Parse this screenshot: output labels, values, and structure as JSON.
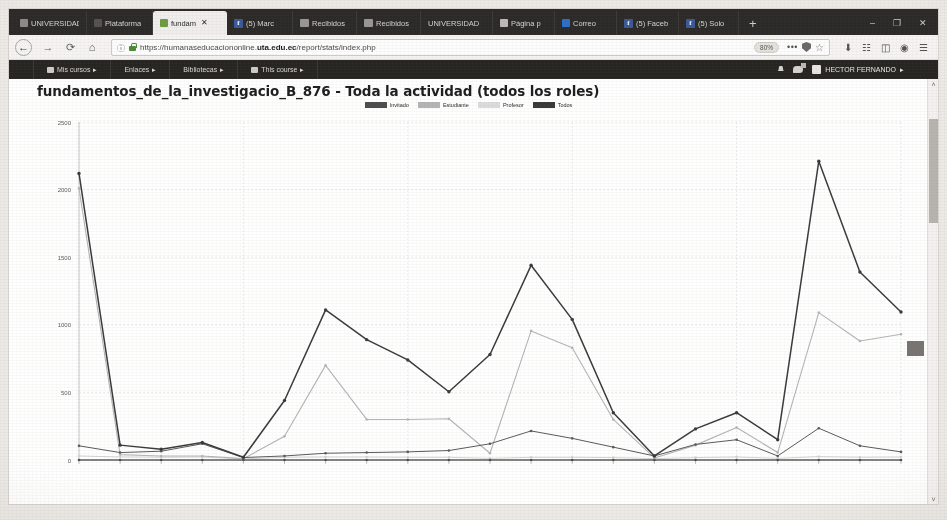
{
  "browser": {
    "tabs": [
      {
        "label": "UNIVERSIDAD",
        "icon": "page-icon",
        "active": false
      },
      {
        "label": "Plataforma",
        "icon": "page-icon",
        "active": false
      },
      {
        "label": "fundam",
        "icon": "moodle-icon",
        "active": true,
        "close": "✕"
      },
      {
        "label": "(5) Marc",
        "icon": "facebook-icon",
        "active": false
      },
      {
        "label": "Recibidos",
        "icon": "mail-icon",
        "active": false
      },
      {
        "label": "Recibidos",
        "icon": "mail-icon",
        "active": false
      },
      {
        "label": "UNIVERSIDAD",
        "icon": "page-icon",
        "active": false
      },
      {
        "label": "Página p",
        "icon": "page-icon",
        "active": false
      },
      {
        "label": "Correo",
        "icon": "outlook-icon",
        "active": false
      },
      {
        "label": "(5) Faceb",
        "icon": "facebook-icon",
        "active": false
      },
      {
        "label": "(5) Solo",
        "icon": "facebook-icon",
        "active": false
      }
    ],
    "new_tab_label": "+",
    "window_buttons": {
      "minimize": "–",
      "maximize": "❐",
      "close": "✕"
    },
    "nav": {
      "back": "←",
      "forward": "→",
      "reload": "⟳",
      "home": "⌂"
    },
    "url": {
      "info_icon": "ⓘ",
      "security_icon": "lock-icon",
      "prefix": "https://humanaseducaciononline.",
      "domain": "uta.edu.ec",
      "path": "/report/stats/index.php",
      "zoom_level": "80%",
      "more_actions": "•••",
      "placeholder": "Buscar o ingresar dirección"
    },
    "toolbar_icons": [
      "download-icon",
      "library-icon",
      "sidebar-icon",
      "account-icon",
      "menu-icon"
    ]
  },
  "moodle": {
    "nav_items": [
      {
        "label": "Mis cursos",
        "caret": "▸",
        "icon": "folder-icon"
      },
      {
        "label": "Enlaces",
        "caret": "▸",
        "icon": ""
      },
      {
        "label": "Bibliotecas",
        "caret": "▸",
        "icon": ""
      },
      {
        "label": "This course",
        "caret": "▸",
        "icon": "book-icon"
      }
    ],
    "notifications_icon": "bell-icon",
    "messages_icon": "message-icon",
    "user_name": "HECTOR FERNANDO",
    "user_caret": "▸"
  },
  "page": {
    "title": "fundamentos_de_la_investigacio_B_876 - Toda la actividad (todos los roles)"
  },
  "chart_data": {
    "type": "line",
    "title": "fundamentos_de_la_investigacio_B_876 - Toda la actividad (todos los roles)",
    "xlabel": "",
    "ylabel": "",
    "ylim": [
      0,
      2500
    ],
    "yticks": [
      0,
      500,
      1000,
      1500,
      2000,
      2500
    ],
    "ytick_labels": [
      "0",
      "500",
      "1000",
      "1500",
      "2000",
      "2500"
    ],
    "grid": true,
    "legend_position": "top-center",
    "x": [
      1,
      2,
      3,
      4,
      5,
      6,
      7,
      8,
      9,
      10,
      11,
      12,
      13,
      14,
      15,
      16,
      17,
      18,
      19,
      20,
      21
    ],
    "xtick_labels": [
      "",
      "",
      "",
      "",
      "",
      "",
      "",
      "",
      "",
      "",
      "",
      "",
      "",
      "",
      "",
      "",
      "",
      "",
      "",
      "",
      ""
    ],
    "series": [
      {
        "name": "Invitado",
        "color": "#4d4d4d",
        "values": [
          0,
          0,
          0,
          0,
          0,
          0,
          0,
          0,
          0,
          0,
          0,
          0,
          0,
          0,
          0,
          0,
          0,
          0,
          0,
          0,
          0
        ]
      },
      {
        "name": "Estudiante",
        "color": "#b5b5b5",
        "values": [
          2010,
          40,
          30,
          30,
          10,
          175,
          700,
          300,
          300,
          305,
          50,
          955,
          830,
          300,
          15,
          110,
          240,
          55,
          1090,
          880,
          930
        ]
      },
      {
        "name": "Profesor",
        "color": "#d4d4d4",
        "values": [
          30,
          22,
          20,
          22,
          8,
          20,
          22,
          22,
          20,
          20,
          12,
          20,
          20,
          18,
          10,
          18,
          22,
          12,
          25,
          20,
          22
        ]
      },
      {
        "name": "Todos",
        "color": "#3a3a3a",
        "values": [
          2120,
          110,
          80,
          130,
          20,
          440,
          1110,
          890,
          740,
          505,
          780,
          1440,
          1040,
          350,
          30,
          230,
          350,
          150,
          2210,
          1390,
          1095
        ]
      },
      {
        "name": "Todos-lower",
        "color": "#5a5a5a",
        "values": [
          105,
          55,
          65,
          120,
          18,
          30,
          50,
          55,
          60,
          70,
          120,
          215,
          160,
          95,
          30,
          115,
          150,
          30,
          235,
          105,
          60
        ]
      }
    ]
  },
  "scrollbar": {
    "up_arrow": "˄",
    "down_arrow": "˅"
  }
}
